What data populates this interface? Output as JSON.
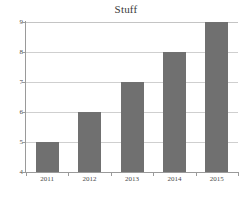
{
  "chart_data": {
    "type": "bar",
    "title": "Stuff",
    "xlabel": "",
    "ylabel": "",
    "categories": [
      "2011",
      "2012",
      "2013",
      "2014",
      "2015"
    ],
    "values": [
      5,
      6,
      7,
      8,
      9
    ],
    "ylim": [
      4,
      9
    ],
    "yticks": [
      4,
      5,
      6,
      7,
      8,
      9
    ],
    "ytick_labels": [
      "4",
      "5",
      "6",
      "7",
      "8",
      "9"
    ],
    "grid": true,
    "grid_axis": "y",
    "legend": false,
    "legend_position": "none",
    "bar_color": "#707070",
    "gridline_color": "#cfcfcf",
    "axis_color": "#9a9a9a",
    "background_color": "#ffffff",
    "text_color": "#4a4a4a"
  }
}
